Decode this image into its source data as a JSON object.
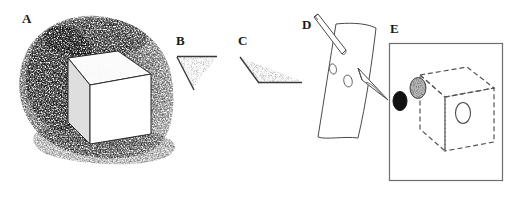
{
  "figure": {
    "background_color": "#ffffff",
    "ink_color": "#1a1a1a",
    "width": 515,
    "height": 198
  },
  "panels": [
    {
      "id": "A",
      "label": "A",
      "label_x": 22,
      "label_y": 18,
      "name": "stippled-shaded-cube",
      "description": "Rectangular box drawn in outline with a white front face, pale top face and light-gray left face, set against a dense stippled/scribbled dark halo with a cast shadow beneath.",
      "elements": [
        "stipple-halo",
        "cast-shadow",
        "cube-top-face",
        "cube-left-face",
        "cube-front-face"
      ]
    },
    {
      "id": "B",
      "label": "B",
      "label_x": 176,
      "label_y": 40,
      "name": "narrow-wedge-angle",
      "description": "Narrow acute wedge: a horizontal top line with a diagonal running down-right from its left end; the enclosed sliver is lightly stippled.",
      "elements": [
        "top-horizontal-line",
        "diagonal-line",
        "wedge-stipple"
      ]
    },
    {
      "id": "C",
      "label": "C",
      "label_x": 238,
      "label_y": 40,
      "name": "obtuse-wedge-angle",
      "description": "Shallow obtuse wedge: a diagonal descending from upper-left meets a long horizontal line running right; the enclosed band is stippled.",
      "elements": [
        "diagonal-line",
        "horizontal-line",
        "wedge-stipple"
      ]
    },
    {
      "id": "D",
      "label": "D",
      "label_x": 302,
      "label_y": 24,
      "name": "rod-piercing-curved-sheet",
      "description": "A curved quadrilateral sheet with two small ellipse holes; a cylindrical rod enters from the upper left, passes through the sheet and emerges at the right as a tapered point.",
      "elements": [
        "curved-sheet",
        "ellipse-hole-upper",
        "ellipse-hole-lower",
        "entering-rod",
        "emerging-point"
      ]
    },
    {
      "id": "E",
      "label": "E",
      "label_x": 390,
      "label_y": 28,
      "name": "framed-dashed-cube",
      "description": "A thin rectangular frame enclosing a cube drawn entirely with dashed lines; a solid black ellipse sits outside at the left, a gray stippled ellipse lies on the left face and a plain white outlined ellipse lies on the front face.",
      "frame": {
        "x": 389,
        "y": 43,
        "width": 114,
        "height": 138
      },
      "elements": [
        "frame-rectangle",
        "dashed-cube",
        "black-ellipse",
        "gray-stippled-ellipse",
        "white-ellipse"
      ]
    }
  ],
  "markers": {
    "black_ellipse_fill": "#111111",
    "gray_ellipse_fill": "#9a9a9a",
    "white_ellipse_fill": "#ffffff",
    "dashed_line_pattern": "5 3"
  }
}
